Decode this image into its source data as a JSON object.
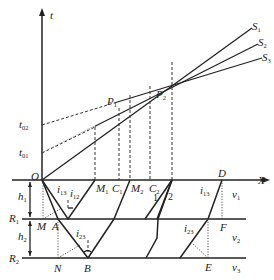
{
  "figure": {
    "axes": {
      "vertical": {
        "label": "t"
      },
      "horizontal": {
        "label": "X"
      },
      "origin": "O"
    },
    "traveltime_lines": [
      {
        "id": "S1",
        "label": "S",
        "sub": "1"
      },
      {
        "id": "S2",
        "label": "S",
        "sub": "2"
      },
      {
        "id": "S3",
        "label": "S",
        "sub": "3"
      }
    ],
    "intercepts": [
      {
        "id": "t01",
        "label": "t",
        "sub": "01"
      },
      {
        "id": "t02",
        "label": "t",
        "sub": "02"
      }
    ],
    "points_upper": [
      {
        "id": "P1",
        "label": "P",
        "sub": "1"
      },
      {
        "id": "P2",
        "label": "P",
        "sub": "2"
      }
    ],
    "surface_points": [
      {
        "id": "M1",
        "label": "M",
        "sub": "1"
      },
      {
        "id": "C1",
        "label": "C",
        "sub": "1"
      },
      {
        "id": "M2",
        "label": "M",
        "sub": "2"
      },
      {
        "id": "C2",
        "label": "C",
        "sub": "2"
      },
      {
        "id": "D",
        "label": "D",
        "sub": ""
      }
    ],
    "ray_labels": [
      "1",
      "2"
    ],
    "angles": [
      {
        "id": "i13a",
        "label": "i",
        "sub": "13"
      },
      {
        "id": "i12",
        "label": "i",
        "sub": "12"
      },
      {
        "id": "i23a",
        "label": "i",
        "sub": "23"
      },
      {
        "id": "i13b",
        "label": "i",
        "sub": "13"
      },
      {
        "id": "i23b",
        "label": "i",
        "sub": "23"
      }
    ],
    "interfaces": [
      {
        "id": "R1",
        "label": "R",
        "sub": "1"
      },
      {
        "id": "R2",
        "label": "R",
        "sub": "2"
      }
    ],
    "thicknesses": [
      {
        "id": "h1",
        "label": "h",
        "sub": "1"
      },
      {
        "id": "h2",
        "label": "h",
        "sub": "2"
      }
    ],
    "velocities": [
      {
        "id": "v1",
        "label": "v",
        "sub": "1"
      },
      {
        "id": "v2",
        "label": "v",
        "sub": "2"
      },
      {
        "id": "v3",
        "label": "v",
        "sub": "3"
      }
    ],
    "layer_points": [
      {
        "id": "M",
        "label": "M"
      },
      {
        "id": "A",
        "label": "A"
      },
      {
        "id": "N",
        "label": "N"
      },
      {
        "id": "B",
        "label": "B"
      },
      {
        "id": "F",
        "label": "F"
      },
      {
        "id": "E",
        "label": "E"
      }
    ],
    "colors": {
      "ink": "#222222",
      "background": "#ffffff"
    }
  }
}
